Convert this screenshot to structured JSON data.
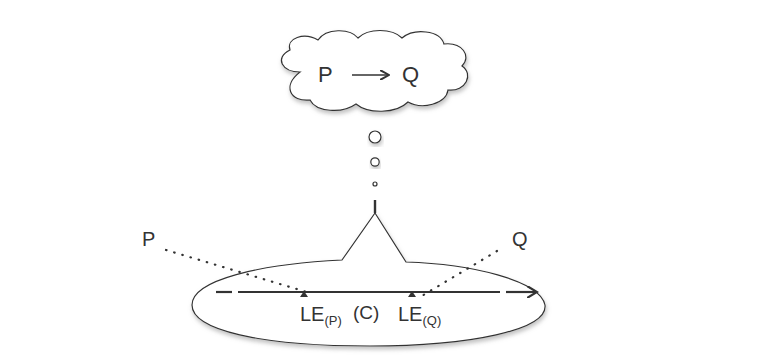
{
  "diagram": {
    "thought_cloud": {
      "left_label": "P",
      "arrow_glyph": "→",
      "right_label": "Q"
    },
    "main_timeline": {
      "direction": "right"
    },
    "outer_labels": {
      "left": "P",
      "right": "Q"
    },
    "inner_timeline": {
      "marker_p_base": "LE",
      "marker_p_sub": "(P)",
      "middle_label": "(C)",
      "marker_q_base": "LE",
      "marker_q_sub": "(Q)"
    },
    "colors": {
      "stroke": "#333333",
      "shadow": "#bbbbbb",
      "background": "#ffffff"
    }
  }
}
